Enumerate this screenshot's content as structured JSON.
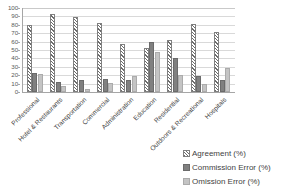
{
  "chart_data": {
    "type": "bar",
    "title": "",
    "xlabel": "",
    "ylabel": "",
    "ylim": [
      0,
      100
    ],
    "yticks": [
      0,
      10,
      20,
      30,
      40,
      50,
      60,
      70,
      80,
      90,
      100
    ],
    "grid": true,
    "legend_position": "bottom-right",
    "categories": [
      "Professional",
      "Hotel & Restaurants",
      "Transportation",
      "Commercial",
      "Administration",
      "Education",
      "Residential",
      "Outdoors & Recreational",
      "Hospitals"
    ],
    "series": [
      {
        "name": "Agreement (%)",
        "color": "#6d6d6d",
        "pattern": "diagonal-hatch",
        "values": [
          80,
          93,
          89,
          82,
          57,
          52,
          62,
          81,
          71
        ]
      },
      {
        "name": "Commission Error (%)",
        "color": "#808080",
        "pattern": "solid",
        "values": [
          23,
          12,
          14,
          16,
          14,
          60,
          41,
          19,
          14
        ]
      },
      {
        "name": "Omission Error (%)",
        "color": "#c4c4c4",
        "pattern": "solid",
        "values": [
          21,
          7,
          4,
          11,
          19,
          48,
          20,
          10,
          28
        ]
      }
    ]
  },
  "legend": {
    "items": [
      {
        "label": "Agreement (%)"
      },
      {
        "label": "Commission Error (%)"
      },
      {
        "label": "Omission Error (%)"
      }
    ]
  }
}
